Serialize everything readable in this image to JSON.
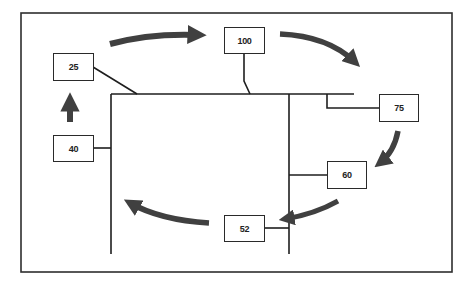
{
  "diagram": {
    "type": "flow-cycle",
    "frame": {
      "x": 21,
      "y": 13,
      "width": 431,
      "height": 259
    },
    "colors": {
      "line": "#1e1e1e",
      "arrow": "#404040",
      "box_border": "#2a2a2a",
      "background": "#ffffff"
    },
    "nodes": [
      {
        "id": "n25",
        "label": "25",
        "x": 53,
        "y": 53,
        "w": 41,
        "h": 28
      },
      {
        "id": "n100",
        "label": "100",
        "x": 224,
        "y": 27,
        "w": 41,
        "h": 27
      },
      {
        "id": "n75",
        "label": "75",
        "x": 379,
        "y": 94,
        "w": 40,
        "h": 28
      },
      {
        "id": "n60",
        "label": "60",
        "x": 327,
        "y": 161,
        "w": 40,
        "h": 28
      },
      {
        "id": "n52",
        "label": "52",
        "x": 224,
        "y": 215,
        "w": 41,
        "h": 27
      },
      {
        "id": "n40",
        "label": "40",
        "x": 53,
        "y": 135,
        "w": 41,
        "h": 27
      }
    ],
    "flow_order": [
      "40",
      "25",
      "100",
      "75",
      "60",
      "52",
      "40"
    ],
    "arrows": [
      {
        "from": "40",
        "to": "25",
        "direction": "up"
      },
      {
        "from": "25",
        "to": "100",
        "direction": "right"
      },
      {
        "from": "100",
        "to": "75",
        "direction": "curve-down-right"
      },
      {
        "from": "75",
        "to": "60",
        "direction": "curve-down-left"
      },
      {
        "from": "60",
        "to": "52",
        "direction": "curve-left"
      },
      {
        "from": "52",
        "to": "40",
        "direction": "curve-up-left"
      }
    ]
  }
}
